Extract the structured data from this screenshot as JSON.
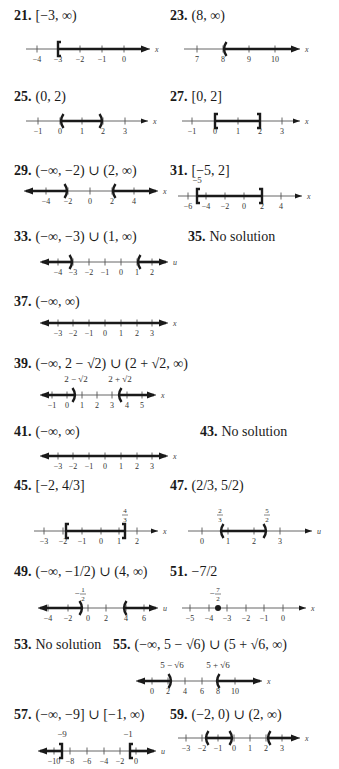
{
  "answers": [
    {
      "num": "21.",
      "text": "[−3, ∞)",
      "x": 14,
      "y": 8,
      "line": {
        "y": 49,
        "x0": 26,
        "x1": 150,
        "var": "x",
        "left_arrow": false,
        "right_arrow": true,
        "ticks": [
          {
            "v": "−4",
            "x": 37
          },
          {
            "v": "−3",
            "x": 58
          },
          {
            "v": "−2",
            "x": 80
          },
          {
            "v": "−1",
            "x": 102
          },
          {
            "v": "0",
            "x": 124
          }
        ],
        "segments": [
          {
            "from": 58,
            "to": 146
          }
        ],
        "endpoints": [
          {
            "x": 58,
            "type": "["
          }
        ],
        "labels": []
      }
    },
    {
      "num": "23.",
      "text": "(8, ∞)",
      "x": 170,
      "y": 8,
      "line": {
        "y": 49,
        "x0": 184,
        "x1": 300,
        "var": "x",
        "left_arrow": false,
        "right_arrow": true,
        "ticks": [
          {
            "v": "7",
            "x": 197
          },
          {
            "v": "8",
            "x": 223
          },
          {
            "v": "9",
            "x": 249
          },
          {
            "v": "10",
            "x": 275
          }
        ],
        "segments": [
          {
            "from": 223,
            "to": 296
          }
        ],
        "endpoints": [
          {
            "x": 223,
            "type": "("
          }
        ],
        "labels": []
      }
    },
    {
      "num": "25.",
      "text": "(0, 2)",
      "x": 14,
      "y": 89,
      "line": {
        "y": 121,
        "x0": 26,
        "x1": 148,
        "var": "x",
        "left_arrow": false,
        "right_arrow": true,
        "ticks": [
          {
            "v": "−1",
            "x": 38
          },
          {
            "v": "0",
            "x": 60
          },
          {
            "v": "1",
            "x": 82
          },
          {
            "v": "2",
            "x": 103
          },
          {
            "v": "3",
            "x": 125
          }
        ],
        "segments": [
          {
            "from": 60,
            "to": 103
          }
        ],
        "endpoints": [
          {
            "x": 60,
            "type": "("
          },
          {
            "x": 103,
            "type": ")"
          }
        ],
        "labels": []
      }
    },
    {
      "num": "27.",
      "text": "[0, 2]",
      "x": 170,
      "y": 89,
      "line": {
        "y": 121,
        "x0": 182,
        "x1": 300,
        "var": "x",
        "left_arrow": false,
        "right_arrow": true,
        "ticks": [
          {
            "v": "−1",
            "x": 192
          },
          {
            "v": "0",
            "x": 215
          },
          {
            "v": "1",
            "x": 238
          },
          {
            "v": "2",
            "x": 260
          },
          {
            "v": "3",
            "x": 282
          }
        ],
        "segments": [
          {
            "from": 215,
            "to": 260
          }
        ],
        "endpoints": [
          {
            "x": 215,
            "type": "["
          },
          {
            "x": 260,
            "type": "]"
          }
        ],
        "labels": []
      }
    },
    {
      "num": "29.",
      "text": "(−∞, −2) ∪ (2, ∞)",
      "x": 14,
      "y": 163,
      "line": {
        "y": 191,
        "x0": 24,
        "x1": 158,
        "var": "x",
        "left_arrow": true,
        "right_arrow": true,
        "ticks": [
          {
            "v": "−4",
            "x": 46
          },
          {
            "v": "−2",
            "x": 68
          },
          {
            "v": "0",
            "x": 90
          },
          {
            "v": "2",
            "x": 112
          },
          {
            "v": "4",
            "x": 134
          }
        ],
        "segments": [
          {
            "from": 26,
            "to": 68
          },
          {
            "from": 112,
            "to": 156
          }
        ],
        "endpoints": [
          {
            "x": 68,
            "type": ")"
          },
          {
            "x": 112,
            "type": "("
          }
        ],
        "labels": []
      }
    },
    {
      "num": "31.",
      "text": "[−5, 2]",
      "x": 170,
      "y": 163,
      "line": {
        "y": 196,
        "x0": 178,
        "x1": 302,
        "var": "x",
        "left_arrow": false,
        "right_arrow": true,
        "ticks": [
          {
            "v": "−6",
            "x": 188
          },
          {
            "v": "−4",
            "x": 206
          },
          {
            "v": "−2",
            "x": 225
          },
          {
            "v": "0",
            "x": 244
          },
          {
            "v": "2",
            "x": 262
          },
          {
            "v": "4",
            "x": 281
          }
        ],
        "segments": [
          {
            "from": 197,
            "to": 262
          }
        ],
        "endpoints": [
          {
            "x": 197,
            "type": "["
          },
          {
            "x": 262,
            "type": "]"
          }
        ],
        "labels": [
          {
            "text": "−5",
            "x": 197,
            "dy": -13
          }
        ]
      }
    },
    {
      "num": "33.",
      "text": "(−∞, −3) ∪ (1, ∞)",
      "x": 14,
      "y": 229,
      "line": {
        "y": 262,
        "x0": 40,
        "x1": 168,
        "var": "u",
        "left_arrow": true,
        "right_arrow": true,
        "ticks": [
          {
            "v": "−4",
            "x": 58
          },
          {
            "v": "−3",
            "x": 73
          },
          {
            "v": "−2",
            "x": 89
          },
          {
            "v": "−1",
            "x": 105
          },
          {
            "v": "0",
            "x": 121
          },
          {
            "v": "1",
            "x": 137
          },
          {
            "v": "2",
            "x": 152
          }
        ],
        "segments": [
          {
            "from": 42,
            "to": 73
          },
          {
            "from": 137,
            "to": 166
          }
        ],
        "endpoints": [
          {
            "x": 73,
            "type": ")"
          },
          {
            "x": 137,
            "type": "("
          }
        ],
        "labels": []
      }
    },
    {
      "num": "35.",
      "text": "No solution",
      "x": 188,
      "y": 229,
      "line": null
    },
    {
      "num": "37.",
      "text": "(−∞, ∞)",
      "x": 14,
      "y": 294,
      "line": {
        "y": 323,
        "x0": 40,
        "x1": 168,
        "var": "x",
        "left_arrow": true,
        "right_arrow": true,
        "ticks": [
          {
            "v": "−3",
            "x": 58
          },
          {
            "v": "−2",
            "x": 73
          },
          {
            "v": "−1",
            "x": 89
          },
          {
            "v": "0",
            "x": 105
          },
          {
            "v": "1",
            "x": 121
          },
          {
            "v": "2",
            "x": 137
          },
          {
            "v": "3",
            "x": 152
          }
        ],
        "segments": [
          {
            "from": 42,
            "to": 166
          }
        ],
        "endpoints": [],
        "labels": []
      }
    },
    {
      "num": "39.",
      "text": "(−∞, 2 − √2) ∪ (2 + √2, ∞)",
      "x": 14,
      "y": 356,
      "line": {
        "y": 395,
        "x0": 40,
        "x1": 156,
        "var": "x",
        "left_arrow": true,
        "right_arrow": true,
        "ticks": [
          {
            "v": "−1",
            "x": 52
          },
          {
            "v": "0",
            "x": 67
          },
          {
            "v": "1",
            "x": 82
          },
          {
            "v": "2",
            "x": 97
          },
          {
            "v": "3",
            "x": 112
          },
          {
            "v": "4",
            "x": 127
          },
          {
            "v": "5",
            "x": 142
          }
        ],
        "segments": [
          {
            "from": 42,
            "to": 76
          },
          {
            "from": 118,
            "to": 154
          }
        ],
        "endpoints": [
          {
            "x": 76,
            "type": ")"
          },
          {
            "x": 118,
            "type": "("
          }
        ],
        "labels": [
          {
            "text": "2 − √2",
            "x": 76,
            "dy": -13
          },
          {
            "text": "2 + √2",
            "x": 120,
            "dy": -13
          }
        ]
      }
    },
    {
      "num": "41.",
      "text": "(−∞, ∞)",
      "x": 14,
      "y": 424,
      "line": {
        "y": 456,
        "x0": 40,
        "x1": 168,
        "var": "x",
        "left_arrow": true,
        "right_arrow": true,
        "ticks": [
          {
            "v": "−3",
            "x": 58
          },
          {
            "v": "−2",
            "x": 73
          },
          {
            "v": "−1",
            "x": 89
          },
          {
            "v": "0",
            "x": 105
          },
          {
            "v": "1",
            "x": 121
          },
          {
            "v": "2",
            "x": 137
          },
          {
            "v": "3",
            "x": 152
          }
        ],
        "segments": [
          {
            "from": 42,
            "to": 166
          }
        ],
        "endpoints": [],
        "labels": []
      }
    },
    {
      "num": "43.",
      "text": "No solution",
      "x": 200,
      "y": 424,
      "line": null
    },
    {
      "num": "45.",
      "text": "[−2, 4/3]",
      "x": 14,
      "y": 478,
      "line": {
        "y": 531,
        "x0": 34,
        "x1": 158,
        "var": "x",
        "left_arrow": false,
        "right_arrow": true,
        "ticks": [
          {
            "v": "−3",
            "x": 44
          },
          {
            "v": "−2",
            "x": 63
          },
          {
            "v": "−1",
            "x": 82
          },
          {
            "v": "0",
            "x": 101
          },
          {
            "v": "1",
            "x": 119
          },
          {
            "v": "2",
            "x": 137
          }
        ],
        "segments": [
          {
            "from": 66,
            "to": 125
          }
        ],
        "endpoints": [
          {
            "x": 66,
            "type": "["
          },
          {
            "x": 125,
            "type": "]"
          }
        ],
        "labels": [
          {
            "text": "4/3",
            "x": 125,
            "dy": -17,
            "frac": true
          }
        ]
      }
    },
    {
      "num": "47.",
      "text": "(2/3, 5/2)",
      "x": 170,
      "y": 478,
      "line": {
        "y": 531,
        "x0": 188,
        "x1": 312,
        "var": "u",
        "left_arrow": false,
        "right_arrow": true,
        "ticks": [
          {
            "v": "0",
            "x": 202
          },
          {
            "v": "1",
            "x": 228
          },
          {
            "v": "2",
            "x": 254
          },
          {
            "v": "3",
            "x": 280
          }
        ],
        "segments": [
          {
            "from": 220,
            "to": 267
          }
        ],
        "endpoints": [
          {
            "x": 220,
            "type": "("
          },
          {
            "x": 267,
            "type": ")"
          }
        ],
        "labels": [
          {
            "text": "2/3",
            "x": 220,
            "dy": -17,
            "frac": true
          },
          {
            "text": "5/2",
            "x": 267,
            "dy": -17,
            "frac": true
          }
        ]
      }
    },
    {
      "num": "49.",
      "text": "(−∞, −1/2) ∪ (4, ∞)",
      "x": 14,
      "y": 564,
      "line": {
        "y": 608,
        "x0": 38,
        "x1": 158,
        "var": "u",
        "left_arrow": true,
        "right_arrow": true,
        "ticks": [
          {
            "v": "−4",
            "x": 48
          },
          {
            "v": "−2",
            "x": 68
          },
          {
            "v": "0",
            "x": 88
          },
          {
            "v": "2",
            "x": 106
          },
          {
            "v": "4",
            "x": 126
          },
          {
            "v": "6",
            "x": 144
          }
        ],
        "segments": [
          {
            "from": 40,
            "to": 83
          },
          {
            "from": 123,
            "to": 156
          }
        ],
        "endpoints": [
          {
            "x": 83,
            "type": ")"
          },
          {
            "x": 123,
            "type": "("
          }
        ],
        "labels": [
          {
            "text": "1/2",
            "x": 83,
            "dy": -15,
            "frac": true,
            "neg": true
          }
        ]
      }
    },
    {
      "num": "51.",
      "text": "−7/2",
      "x": 170,
      "y": 564,
      "line": {
        "y": 608,
        "x0": 182,
        "x1": 306,
        "var": "x",
        "left_arrow": false,
        "right_arrow": true,
        "ticks": [
          {
            "v": "−5",
            "x": 190
          },
          {
            "v": "−4",
            "x": 209
          },
          {
            "v": "−3",
            "x": 227
          },
          {
            "v": "−2",
            "x": 246
          },
          {
            "v": "−1",
            "x": 264
          },
          {
            "v": "0",
            "x": 283
          }
        ],
        "segments": [],
        "endpoints": [
          {
            "x": 218,
            "type": "dot"
          }
        ],
        "labels": [
          {
            "text": "7/2",
            "x": 218,
            "dy": -15,
            "frac": true,
            "neg": true
          }
        ]
      }
    },
    {
      "num": "53.",
      "text": "No solution",
      "x": 14,
      "y": 637,
      "line": null
    },
    {
      "num": "55.",
      "text": "(−∞, 5 − √6) ∪ (5 + √6, ∞)",
      "x": 113,
      "y": 637,
      "line": {
        "y": 681,
        "x0": 136,
        "x1": 262,
        "var": "x",
        "left_arrow": true,
        "right_arrow": true,
        "ticks": [
          {
            "v": "0",
            "x": 152
          },
          {
            "v": "2",
            "x": 168
          },
          {
            "v": "4",
            "x": 185
          },
          {
            "v": "6",
            "x": 202
          },
          {
            "v": "8",
            "x": 218
          },
          {
            "v": "10",
            "x": 235
          }
        ],
        "segments": [
          {
            "from": 138,
            "to": 172
          },
          {
            "from": 216,
            "to": 260
          }
        ],
        "endpoints": [
          {
            "x": 172,
            "type": ")"
          },
          {
            "x": 216,
            "type": "("
          }
        ],
        "labels": [
          {
            "text": "5 − √6",
            "x": 172,
            "dy": -13
          },
          {
            "text": "5 + √6",
            "x": 218,
            "dy": -13
          }
        ]
      }
    },
    {
      "num": "57.",
      "text": "(−∞, −9] ∪ [−1, ∞)",
      "x": 14,
      "y": 707,
      "line": {
        "y": 751,
        "x0": 38,
        "x1": 156,
        "var": "u",
        "left_arrow": true,
        "right_arrow": true,
        "ticks": [
          {
            "v": "−10",
            "x": 54
          },
          {
            "v": "−8",
            "x": 70
          },
          {
            "v": "−6",
            "x": 87
          },
          {
            "v": "−4",
            "x": 104
          },
          {
            "v": "−2",
            "x": 120
          },
          {
            "v": "0",
            "x": 136
          }
        ],
        "segments": [
          {
            "from": 40,
            "to": 62
          },
          {
            "from": 130,
            "to": 154
          }
        ],
        "endpoints": [
          {
            "x": 62,
            "type": "]"
          },
          {
            "x": 130,
            "type": "["
          }
        ],
        "labels": [
          {
            "text": "−9",
            "x": 62,
            "dy": -14
          },
          {
            "text": "−1",
            "x": 128,
            "dy": -14
          }
        ]
      }
    },
    {
      "num": "59.",
      "text": "(−2, 0) ∪ (2, ∞)",
      "x": 170,
      "y": 707,
      "line": {
        "y": 738,
        "x0": 178,
        "x1": 300,
        "var": "x",
        "left_arrow": false,
        "right_arrow": true,
        "ticks": [
          {
            "v": "−3",
            "x": 186
          },
          {
            "v": "−2",
            "x": 202
          },
          {
            "v": "−1",
            "x": 218
          },
          {
            "v": "0",
            "x": 234
          },
          {
            "v": "1",
            "x": 250
          },
          {
            "v": "2",
            "x": 266
          },
          {
            "v": "3",
            "x": 282
          }
        ],
        "segments": [
          {
            "from": 205,
            "to": 233
          },
          {
            "from": 267,
            "to": 296
          }
        ],
        "endpoints": [
          {
            "x": 205,
            "type": "("
          },
          {
            "x": 233,
            "type": ")"
          },
          {
            "x": 267,
            "type": "("
          }
        ],
        "labels": []
      }
    }
  ],
  "colors": {
    "ink": "#1a1a1a",
    "axis": "#555555",
    "tick_text": "#333333",
    "background": "#ffffff"
  }
}
